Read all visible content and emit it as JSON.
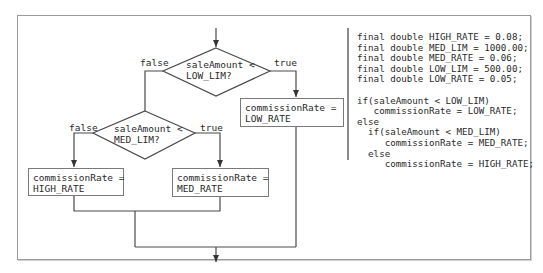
{
  "flowchart": {
    "decision1": {
      "line1": "saleAmount <",
      "line2": "LOW_LIM?",
      "false_label": "false",
      "true_label": "true"
    },
    "decision2": {
      "line1": "saleAmount <",
      "line2": "MED_LIM?",
      "false_label": "false",
      "true_label": "true"
    },
    "box_low": {
      "line1": "commissionRate =",
      "line2": "LOW_RATE"
    },
    "box_high": {
      "line1": "commissionRate =",
      "line2": "HIGH_RATE"
    },
    "box_med": {
      "line1": "commissionRate =",
      "line2": "MED_RATE"
    }
  },
  "code": {
    "lines": [
      "final double HIGH_RATE = 0.08;",
      "final double MED_LIM = 1000.00;",
      "final double MED_RATE = 0.06;",
      "final double LOW_LIM = 500.00;",
      "final double LOW_RATE = 0.05;",
      "",
      "if(saleAmount < LOW_LIM)",
      "   commissionRate = LOW_RATE;",
      "else",
      "  if(saleAmount < MED_LIM)",
      "     commissionRate = MED_RATE;",
      "  else",
      "     commissionRate = HIGH_RATE;"
    ]
  },
  "colors": {
    "line": "#4a4a4a",
    "frame": "#9a9a9a",
    "text": "#2a2a2a"
  }
}
